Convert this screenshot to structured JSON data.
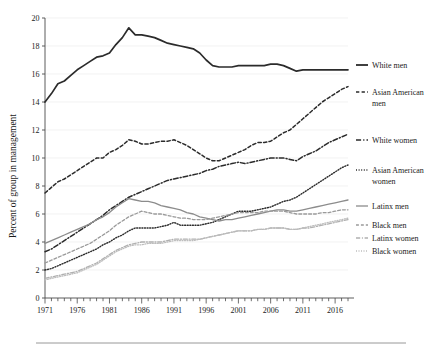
{
  "chart_data": {
    "type": "line",
    "title": "",
    "xlabel": "",
    "ylabel": "Percent of group in management",
    "xlim": [
      1971,
      2018
    ],
    "ylim": [
      0,
      20
    ],
    "grid": true,
    "legend_position": "right",
    "x_tick_labels": [
      "1971",
      "1976",
      "1981",
      "1986",
      "1991",
      "1996",
      "2001",
      "2006",
      "2011",
      "2016"
    ],
    "x_tick_values": [
      1971,
      1976,
      1981,
      1986,
      1991,
      1996,
      2001,
      2006,
      2011,
      2016
    ],
    "y_tick_labels": [
      "0",
      "2",
      "4",
      "6",
      "8",
      "10",
      "12",
      "14",
      "16",
      "18",
      "20"
    ],
    "y_tick_values": [
      0,
      2,
      4,
      6,
      8,
      10,
      12,
      14,
      16,
      18,
      20
    ],
    "x": [
      1971,
      1972,
      1973,
      1974,
      1975,
      1976,
      1977,
      1978,
      1979,
      1980,
      1981,
      1982,
      1983,
      1984,
      1985,
      1986,
      1987,
      1988,
      1989,
      1990,
      1991,
      1992,
      1993,
      1994,
      1995,
      1996,
      1997,
      1998,
      1999,
      2000,
      2001,
      2002,
      2003,
      2004,
      2005,
      2006,
      2007,
      2008,
      2009,
      2010,
      2011,
      2012,
      2013,
      2014,
      2015,
      2016,
      2017,
      2018
    ],
    "series": [
      {
        "name": "White men",
        "style": "solid",
        "color": "#2b2b2b",
        "width": 1.7,
        "values": [
          14.0,
          14.6,
          15.3,
          15.5,
          15.9,
          16.3,
          16.6,
          16.9,
          17.2,
          17.3,
          17.5,
          18.1,
          18.6,
          19.3,
          18.8,
          18.8,
          18.7,
          18.6,
          18.4,
          18.2,
          18.1,
          18.0,
          17.9,
          17.8,
          17.5,
          17.0,
          16.6,
          16.5,
          16.5,
          16.5,
          16.6,
          16.6,
          16.6,
          16.6,
          16.6,
          16.7,
          16.7,
          16.6,
          16.4,
          16.2,
          16.3,
          16.3,
          16.3,
          16.3,
          16.3,
          16.3,
          16.3,
          16.3
        ]
      },
      {
        "name": "Asian American men",
        "style": "dashed",
        "color": "#2b2b2b",
        "width": 1.5,
        "values": [
          7.5,
          7.9,
          8.3,
          8.5,
          8.8,
          9.1,
          9.4,
          9.7,
          10.0,
          10.0,
          10.4,
          10.6,
          10.9,
          11.3,
          11.2,
          11.0,
          11.0,
          11.1,
          11.2,
          11.2,
          11.3,
          11.1,
          10.9,
          10.6,
          10.3,
          10.0,
          9.8,
          9.8,
          10.0,
          10.2,
          10.4,
          10.6,
          10.9,
          11.1,
          11.1,
          11.2,
          11.5,
          11.8,
          12.0,
          12.4,
          12.8,
          13.2,
          13.6,
          14.0,
          14.3,
          14.6,
          14.9,
          15.1
        ]
      },
      {
        "name": "White women",
        "style": "dashdot",
        "color": "#2b2b2b",
        "width": 1.5,
        "values": [
          3.3,
          3.5,
          3.8,
          4.1,
          4.4,
          4.7,
          5.0,
          5.3,
          5.6,
          5.9,
          6.3,
          6.6,
          6.9,
          7.2,
          7.4,
          7.6,
          7.8,
          8.0,
          8.2,
          8.4,
          8.5,
          8.6,
          8.7,
          8.8,
          8.9,
          9.1,
          9.2,
          9.4,
          9.5,
          9.6,
          9.7,
          9.6,
          9.7,
          9.8,
          9.9,
          10.0,
          10.0,
          10.0,
          9.9,
          9.8,
          10.1,
          10.3,
          10.5,
          10.8,
          11.1,
          11.3,
          11.5,
          11.7
        ]
      },
      {
        "name": "Asian American women",
        "style": "dotted",
        "color": "#2b2b2b",
        "width": 1.4,
        "values": [
          2.0,
          2.1,
          2.3,
          2.5,
          2.7,
          2.9,
          3.1,
          3.3,
          3.5,
          3.8,
          4.0,
          4.3,
          4.5,
          4.8,
          5.0,
          5.0,
          5.0,
          5.0,
          5.1,
          5.2,
          5.4,
          5.2,
          5.2,
          5.2,
          5.2,
          5.3,
          5.4,
          5.6,
          5.8,
          6.0,
          6.2,
          6.2,
          6.2,
          6.3,
          6.4,
          6.5,
          6.7,
          6.9,
          7.0,
          7.2,
          7.5,
          7.8,
          8.1,
          8.4,
          8.7,
          9.0,
          9.3,
          9.5
        ]
      },
      {
        "name": "Latinx men",
        "style": "solid",
        "color": "#8c8c8c",
        "width": 1.3,
        "values": [
          3.9,
          4.1,
          4.3,
          4.5,
          4.7,
          4.9,
          5.1,
          5.3,
          5.6,
          5.8,
          6.1,
          6.5,
          6.8,
          7.1,
          7.0,
          6.9,
          6.9,
          6.8,
          6.6,
          6.5,
          6.4,
          6.3,
          6.1,
          6.0,
          5.8,
          5.7,
          5.6,
          5.5,
          5.6,
          5.6,
          5.7,
          5.8,
          5.9,
          6.0,
          6.1,
          6.2,
          6.3,
          6.3,
          6.2,
          6.2,
          6.3,
          6.4,
          6.5,
          6.6,
          6.7,
          6.8,
          6.9,
          7.0
        ]
      },
      {
        "name": "Black men",
        "style": "dashed",
        "color": "#9a9a9a",
        "width": 1.3,
        "values": [
          2.5,
          2.7,
          2.9,
          3.1,
          3.3,
          3.5,
          3.7,
          3.9,
          4.2,
          4.5,
          4.8,
          5.2,
          5.5,
          5.8,
          6.0,
          6.2,
          6.1,
          6.0,
          6.0,
          5.9,
          5.8,
          5.7,
          5.7,
          5.6,
          5.6,
          5.6,
          5.7,
          5.8,
          5.9,
          6.0,
          6.1,
          6.1,
          6.1,
          6.1,
          6.2,
          6.2,
          6.2,
          6.2,
          6.1,
          6.0,
          6.0,
          6.0,
          6.0,
          6.1,
          6.1,
          6.2,
          6.3,
          6.3
        ]
      },
      {
        "name": "Latinx women",
        "style": "dashdot",
        "color": "#b0b0b0",
        "width": 1.3,
        "values": [
          1.4,
          1.5,
          1.6,
          1.7,
          1.8,
          1.9,
          2.1,
          2.3,
          2.5,
          2.8,
          3.1,
          3.4,
          3.6,
          3.8,
          3.9,
          4.0,
          4.0,
          4.0,
          4.0,
          4.1,
          4.2,
          4.2,
          4.2,
          4.2,
          4.2,
          4.3,
          4.4,
          4.5,
          4.6,
          4.7,
          4.8,
          4.8,
          4.8,
          4.9,
          4.9,
          5.0,
          5.0,
          5.0,
          4.9,
          4.9,
          5.0,
          5.0,
          5.1,
          5.2,
          5.3,
          5.4,
          5.5,
          5.6
        ]
      },
      {
        "name": "Black women",
        "style": "dotted",
        "color": "#bdbdbd",
        "width": 1.3,
        "values": [
          1.3,
          1.4,
          1.5,
          1.6,
          1.7,
          1.8,
          2.0,
          2.2,
          2.4,
          2.7,
          3.0,
          3.3,
          3.5,
          3.7,
          3.8,
          3.8,
          3.9,
          3.9,
          3.9,
          4.0,
          4.1,
          4.1,
          4.1,
          4.1,
          4.2,
          4.3,
          4.4,
          4.5,
          4.6,
          4.7,
          4.8,
          4.8,
          4.8,
          4.9,
          4.9,
          5.0,
          5.0,
          5.0,
          4.9,
          4.9,
          5.0,
          5.1,
          5.2,
          5.3,
          5.4,
          5.5,
          5.6,
          5.7
        ]
      }
    ],
    "legend": [
      {
        "label": "White men",
        "style": "solid",
        "color": "#2b2b2b",
        "width": 1.8,
        "lines": [
          "White men"
        ]
      },
      {
        "label": "Asian American men",
        "style": "dashed",
        "color": "#2b2b2b",
        "width": 1.5,
        "lines": [
          "Asian American",
          "men"
        ]
      },
      {
        "label": "White women",
        "style": "dashdot",
        "color": "#2b2b2b",
        "width": 1.6,
        "lines": [
          "White women"
        ]
      },
      {
        "label": "Asian American women",
        "style": "dotted",
        "color": "#2b2b2b",
        "width": 1.4,
        "lines": [
          "Asian American",
          "women"
        ]
      },
      {
        "label": "Latinx men",
        "style": "solid",
        "color": "#8c8c8c",
        "width": 1.3,
        "lines": [
          "Latinx men"
        ]
      },
      {
        "label": "Black men",
        "style": "dashed",
        "color": "#9a9a9a",
        "width": 1.3,
        "lines": [
          "Black men"
        ]
      },
      {
        "label": "Latinx women",
        "style": "dashdot",
        "color": "#b0b0b0",
        "width": 1.3,
        "lines": [
          "Latinx women"
        ]
      },
      {
        "label": "Black women",
        "style": "dotted",
        "color": "#bdbdbd",
        "width": 1.3,
        "lines": [
          "Black women"
        ]
      }
    ]
  }
}
